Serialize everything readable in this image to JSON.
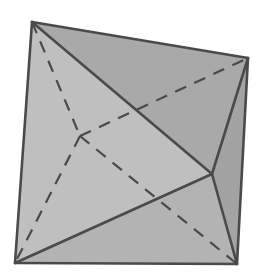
{
  "figure": {
    "width": 270,
    "height": 280,
    "background": "#ffffff"
  },
  "vertices": {
    "A": [
      32,
      22
    ],
    "B": [
      248,
      58
    ],
    "C": [
      212,
      174
    ],
    "D": [
      80,
      136
    ],
    "E": [
      15,
      263
    ],
    "F": [
      237,
      264
    ]
  },
  "faces": [
    {
      "name": "face-left",
      "points": "32,22 80,136 15,263",
      "fill": "#c9c9c9"
    },
    {
      "name": "face-top-back",
      "points": "32,22 248,58 80,136",
      "fill": "#b7b7b7"
    },
    {
      "name": "face-front-left",
      "points": "32,22 212,174 15,263",
      "fill": "#bfbfbf"
    },
    {
      "name": "face-front-top",
      "points": "32,22 248,58 212,174",
      "fill": "#a9a9a9"
    },
    {
      "name": "face-bottom-front",
      "points": "15,263 212,174 237,264",
      "fill": "#b3b3b3"
    },
    {
      "name": "face-right",
      "points": "248,58 237,264 212,174",
      "fill": "#a3a3a3"
    }
  ],
  "solid_edges": [
    {
      "name": "edge-A-B",
      "from": "A",
      "to": "B"
    },
    {
      "name": "edge-A-E",
      "from": "A",
      "to": "E"
    },
    {
      "name": "edge-A-C",
      "from": "A",
      "to": "C"
    },
    {
      "name": "edge-B-C",
      "from": "B",
      "to": "C"
    },
    {
      "name": "edge-B-F",
      "from": "B",
      "to": "F"
    },
    {
      "name": "edge-C-E",
      "from": "C",
      "to": "E"
    },
    {
      "name": "edge-C-F",
      "from": "C",
      "to": "F"
    },
    {
      "name": "edge-E-F",
      "from": "E",
      "to": "F"
    }
  ],
  "dashed_edges": [
    {
      "name": "hidden-edge-A-D",
      "from": "A",
      "to": "D"
    },
    {
      "name": "hidden-edge-D-B",
      "from": "D",
      "to": "B"
    },
    {
      "name": "hidden-edge-D-E",
      "from": "D",
      "to": "E"
    },
    {
      "name": "hidden-edge-D-F",
      "from": "D",
      "to": "F"
    }
  ],
  "style": {
    "edge_color": "#4a4a4a",
    "edge_width": 2.6,
    "dash_pattern": "12,9"
  }
}
